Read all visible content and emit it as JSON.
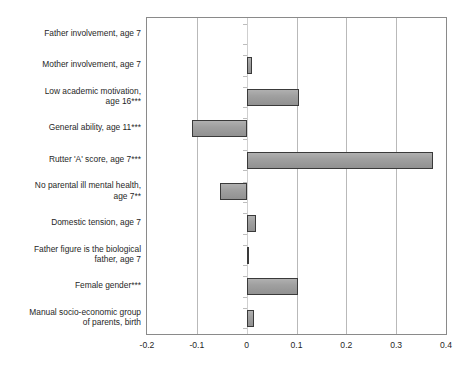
{
  "chart_data": {
    "type": "bar",
    "orientation": "horizontal",
    "title": "",
    "subtitle": "",
    "xlabel": "",
    "ylabel": "",
    "xlim": [
      -0.2,
      0.4
    ],
    "ylim": null,
    "grid": true,
    "legend": null,
    "xticks": [
      "-0.2",
      "-0.1",
      "0",
      "0.1",
      "0.2",
      "0.3",
      "0.4"
    ],
    "xtick_values": [
      -0.2,
      -0.1,
      0,
      0.1,
      0.2,
      0.3,
      0.4
    ],
    "categories": [
      "Father involvement, age 7",
      "Mother involvement, age 7",
      "Low academic motivation,\nage 16***",
      "General ability, age 11***",
      "Rutter 'A' score, age 7***",
      "No parental ill mental health,\nage 7**",
      "Domestic tension, age 7",
      "Father figure is the biological\nfather, age 7",
      "Female gender***",
      "Manual socio-economic group\nof parents, birth"
    ],
    "values": [
      0.0,
      0.01,
      0.106,
      -0.11,
      0.373,
      -0.053,
      0.018,
      0.005,
      0.104,
      0.015
    ],
    "series": [
      {
        "name": "Standardised coefficient",
        "values": [
          0.0,
          0.01,
          0.106,
          -0.11,
          0.373,
          -0.053,
          0.018,
          0.005,
          0.104,
          0.015
        ]
      }
    ],
    "colors": {
      "bar_fill": "#9a9a9a",
      "bar_edge": "#3a3a3a",
      "gridline": "#b9b9b9",
      "axis": "#8a8a8a",
      "background": "#ffffff",
      "text": "#1f1f1f"
    }
  }
}
